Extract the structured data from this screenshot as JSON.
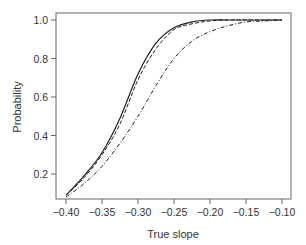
{
  "chart_data": {
    "type": "line",
    "title": "",
    "xlabel": "True slope",
    "ylabel": "Probability",
    "xlim": [
      -0.41,
      -0.095
    ],
    "ylim": [
      0.06,
      1.04
    ],
    "xticks": [
      -0.4,
      -0.35,
      -0.3,
      -0.25,
      -0.2,
      -0.15,
      -0.1
    ],
    "xtick_labels": [
      "−0.40",
      "−0.35",
      "−0.30",
      "−0.25",
      "−0.20",
      "−0.15",
      "−0.10"
    ],
    "yticks": [
      0.2,
      0.4,
      0.6,
      0.8,
      1.0
    ],
    "ytick_labels": [
      "0.2",
      "0.4",
      "0.6",
      "0.8",
      "1.0"
    ],
    "grid": false,
    "legend": null,
    "x": [
      -0.4,
      -0.375,
      -0.35,
      -0.325,
      -0.3,
      -0.275,
      -0.25,
      -0.225,
      -0.2,
      -0.175,
      -0.15,
      -0.125,
      -0.1
    ],
    "series": [
      {
        "name": "solid",
        "style": "solid",
        "values": [
          0.09,
          0.19,
          0.31,
          0.49,
          0.72,
          0.88,
          0.96,
          0.99,
          1.0,
          1.0,
          1.0,
          1.0,
          1.0
        ]
      },
      {
        "name": "dashed",
        "style": "dashed",
        "values": [
          0.09,
          0.18,
          0.3,
          0.46,
          0.69,
          0.85,
          0.95,
          0.98,
          0.995,
          1.0,
          1.0,
          1.0,
          1.0
        ]
      },
      {
        "name": "dash-dot",
        "style": "dashdot",
        "values": [
          0.08,
          0.15,
          0.24,
          0.36,
          0.5,
          0.66,
          0.8,
          0.89,
          0.94,
          0.97,
          0.99,
          0.995,
          1.0
        ]
      }
    ]
  }
}
